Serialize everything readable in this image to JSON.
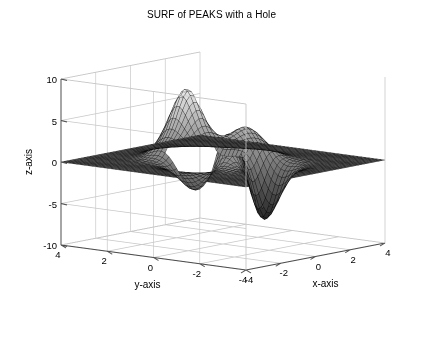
{
  "figure": {
    "title": "SURF of PEAKS with a Hole",
    "background_color": "#ffffff",
    "width": 423,
    "height": 343
  },
  "axes": {
    "x": {
      "label": "x-axis",
      "ticks": [
        "-4",
        "-2",
        "0",
        "2",
        "4"
      ],
      "tick_values": [
        -4,
        -2,
        0,
        2,
        4
      ],
      "range": [
        -4,
        4
      ]
    },
    "y": {
      "label": "y-axis",
      "ticks": [
        "4",
        "2",
        "0",
        "-2",
        "-4"
      ],
      "tick_values": [
        4,
        2,
        0,
        -2,
        -4
      ],
      "range": [
        -4,
        4
      ]
    },
    "z": {
      "label": "z-axis",
      "ticks": [
        "10",
        "5",
        "0",
        "-5",
        "-10"
      ],
      "tick_values": [
        10,
        5,
        0,
        -5,
        -10
      ],
      "range": [
        -10,
        10
      ]
    },
    "grid": true,
    "grid_color": "#c8c8c8",
    "box_color": "#4d4d4d"
  },
  "chart_data": {
    "type": "surface",
    "title": "SURF of PEAKS with a Hole",
    "xlabel": "x-axis",
    "ylabel": "y-axis",
    "zlabel": "z-axis",
    "xlim": [
      -4,
      4
    ],
    "ylim": [
      -4,
      4
    ],
    "zlim": [
      -10,
      10
    ],
    "grid": true,
    "colormap": "gray",
    "shading": "faceted",
    "mesh_color": "#000000",
    "surface_function": "peaks",
    "surface_formula": "z = 3*(1-x)^2*exp(-x^2-(y+1)^2) - 10*(x/5 - x^3 - y^5)*exp(-x^2-y^2) - (1/3)*exp(-(x+1)^2 - y^2)",
    "grid_resolution": {
      "nx": 49,
      "ny": 49
    },
    "hole": {
      "description": "rectangular NaN region removed from surface",
      "x_range": [
        -1.2,
        0.4
      ],
      "y_range": [
        -0.2,
        1.4
      ],
      "fill_color": "#ffffff"
    },
    "features": [
      {
        "name": "main peak",
        "x": -0.01,
        "y": 1.58,
        "z": 8.1
      },
      {
        "name": "secondary peak",
        "x": 1.29,
        "y": -0.01,
        "z": 3.6
      },
      {
        "name": "deep valley",
        "x": 0.23,
        "y": -1.63,
        "z": -6.5
      },
      {
        "name": "shallow dip",
        "x": -1.35,
        "y": 0.21,
        "z": -3.05
      }
    ],
    "view": {
      "azimuth": -37.5,
      "elevation": 30
    },
    "legend": null
  },
  "camera": {
    "origin_px": [
      246,
      270
    ],
    "x_axis_end_px": [
      385,
      243
    ],
    "y_axis_end_px": [
      61,
      245
    ],
    "z_height_px": 166
  }
}
